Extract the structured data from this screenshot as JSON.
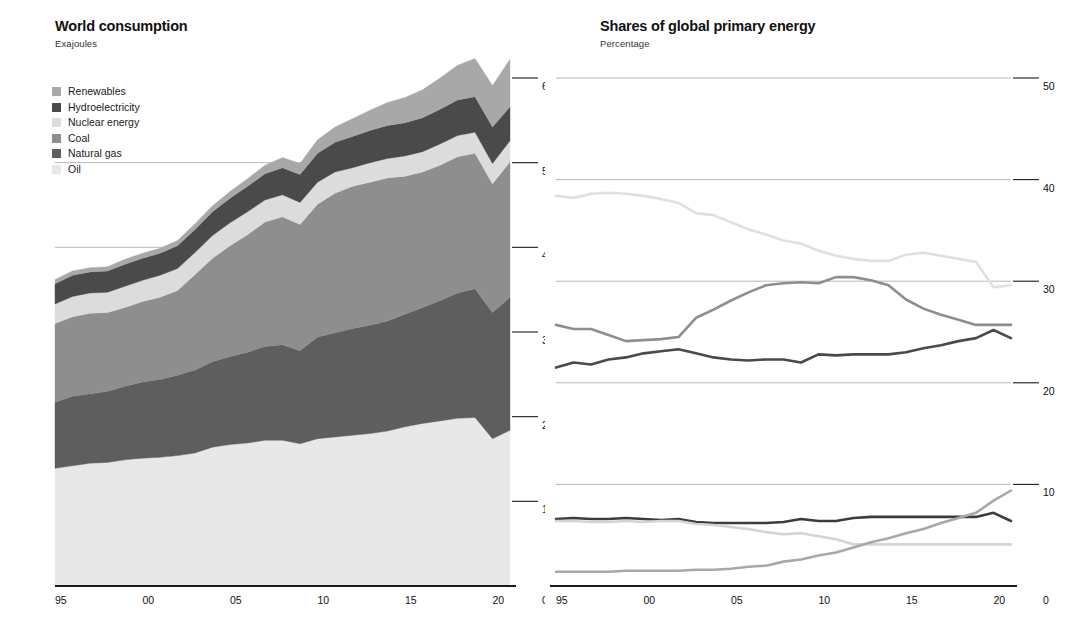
{
  "left": {
    "title": "World consumption",
    "subtitle": "Exajoules",
    "legend": [
      {
        "label": "Renewables",
        "color": "#a8a8a8"
      },
      {
        "label": "Hydroelectricity",
        "color": "#4a4a4a"
      },
      {
        "label": "Nuclear energy",
        "color": "#dcdcdc"
      },
      {
        "label": "Coal",
        "color": "#8e8e8e"
      },
      {
        "label": "Natural gas",
        "color": "#5e5e5e"
      },
      {
        "label": "Oil",
        "color": "#e8e8e8"
      }
    ],
    "y_ticks": [
      "0",
      "100",
      "200",
      "300",
      "400",
      "500",
      "600"
    ],
    "x_ticks": [
      "95",
      "00",
      "05",
      "10",
      "15",
      "20"
    ],
    "axis_zero_right": "0"
  },
  "right": {
    "title": "Shares of global primary energy",
    "subtitle": "Percentage",
    "legend_col1": [
      {
        "label": "Oil",
        "color": "#e0e0e0"
      },
      {
        "label": "Coal",
        "color": "#8e8e8e"
      },
      {
        "label": "Natural gas",
        "color": "#4a4a4a"
      }
    ],
    "legend_col2": [
      {
        "label": "Hydroelectricity",
        "color": "#3c3c3c"
      },
      {
        "label": "Nuclear energy",
        "color": "#d4d4d4"
      },
      {
        "label": "Renewables",
        "color": "#a8a8a8"
      }
    ],
    "y_ticks": [
      "0",
      "10",
      "20",
      "30",
      "40",
      "50"
    ],
    "x_ticks": [
      "95",
      "00",
      "05",
      "10",
      "15",
      "20"
    ],
    "axis_zero_left": "0",
    "axis_zero_right": "0"
  },
  "chart_data": [
    {
      "type": "area",
      "title": "World consumption",
      "subtitle": "Exajoules",
      "xlabel": "",
      "ylabel": "Exajoules",
      "stacked": true,
      "grid": true,
      "legend_position": "inside-top-left",
      "xlim": [
        1995,
        2021
      ],
      "ylim": [
        0,
        600
      ],
      "x": [
        1995,
        1996,
        1997,
        1998,
        1999,
        2000,
        2001,
        2002,
        2003,
        2004,
        2005,
        2006,
        2007,
        2008,
        2009,
        2010,
        2011,
        2012,
        2013,
        2014,
        2015,
        2016,
        2017,
        2018,
        2019,
        2020,
        2021
      ],
      "series": [
        {
          "name": "Oil",
          "color": "#e8e8e8",
          "values": [
            139,
            142,
            145,
            146,
            149,
            151,
            152,
            154,
            157,
            164,
            167,
            169,
            172,
            172,
            168,
            174,
            176,
            178,
            180,
            183,
            188,
            192,
            195,
            198,
            199,
            174,
            184
          ]
        },
        {
          "name": "Natural gas",
          "color": "#5e5e5e",
          "values": [
            78,
            82,
            82,
            84,
            87,
            90,
            92,
            95,
            98,
            101,
            104,
            107,
            111,
            113,
            110,
            120,
            123,
            126,
            128,
            130,
            133,
            137,
            142,
            148,
            152,
            149,
            157
          ]
        },
        {
          "name": "Coal",
          "color": "#8e8e8e",
          "values": [
            93,
            94,
            95,
            93,
            93,
            95,
            97,
            100,
            113,
            122,
            131,
            139,
            147,
            151,
            149,
            157,
            165,
            168,
            169,
            169,
            163,
            160,
            160,
            161,
            160,
            152,
            160
          ]
        },
        {
          "name": "Nuclear energy",
          "color": "#dcdcdc",
          "values": [
            23,
            24,
            24,
            24,
            25,
            25,
            26,
            26,
            26,
            27,
            27,
            27,
            26,
            26,
            26,
            26,
            25,
            22,
            23,
            23,
            24,
            24,
            25,
            25,
            25,
            24,
            25
          ]
        },
        {
          "name": "Hydroelectricity",
          "color": "#4a4a4a",
          "values": [
            24,
            25,
            25,
            25,
            26,
            26,
            26,
            27,
            27,
            28,
            29,
            30,
            31,
            32,
            33,
            34,
            35,
            37,
            38,
            39,
            39,
            40,
            41,
            42,
            42,
            43,
            40
          ]
        },
        {
          "name": "Renewables",
          "color": "#a8a8a8",
          "values": [
            5,
            5,
            5,
            5,
            6,
            6,
            6,
            6,
            7,
            7,
            8,
            9,
            10,
            12,
            13,
            16,
            18,
            21,
            24,
            27,
            30,
            33,
            37,
            41,
            45,
            49,
            56
          ]
        }
      ],
      "totals": [
        362,
        372,
        376,
        377,
        386,
        393,
        399,
        408,
        428,
        449,
        466,
        481,
        497,
        506,
        499,
        527,
        542,
        552,
        562,
        571,
        577,
        586,
        600,
        615,
        623,
        591,
        622
      ]
    },
    {
      "type": "line",
      "title": "Shares of global primary energy",
      "subtitle": "Percentage",
      "xlabel": "",
      "ylabel": "Percentage",
      "grid": true,
      "legend_position": "top-right",
      "xlim": [
        1995,
        2021
      ],
      "ylim": [
        0,
        50
      ],
      "x": [
        1995,
        1996,
        1997,
        1998,
        1999,
        2000,
        2001,
        2002,
        2003,
        2004,
        2005,
        2006,
        2007,
        2008,
        2009,
        2010,
        2011,
        2012,
        2013,
        2014,
        2015,
        2016,
        2017,
        2018,
        2019,
        2020,
        2021
      ],
      "series": [
        {
          "name": "Oil",
          "color": "#e0e0e0",
          "values": [
            38.4,
            38.2,
            38.6,
            38.7,
            38.6,
            38.4,
            38.1,
            37.7,
            36.7,
            36.5,
            35.8,
            35.1,
            34.6,
            34.0,
            33.7,
            33.0,
            32.5,
            32.2,
            32.0,
            32.0,
            32.6,
            32.8,
            32.5,
            32.2,
            31.9,
            29.4,
            29.6
          ]
        },
        {
          "name": "Coal",
          "color": "#8e8e8e",
          "values": [
            25.7,
            25.3,
            25.3,
            24.7,
            24.1,
            24.2,
            24.3,
            24.5,
            26.4,
            27.2,
            28.1,
            28.9,
            29.6,
            29.8,
            29.9,
            29.8,
            30.4,
            30.4,
            30.1,
            29.6,
            28.2,
            27.3,
            26.7,
            26.2,
            25.7,
            25.7,
            25.7
          ]
        },
        {
          "name": "Natural gas",
          "color": "#4a4a4a",
          "values": [
            21.5,
            22.0,
            21.8,
            22.3,
            22.5,
            22.9,
            23.1,
            23.3,
            22.9,
            22.5,
            22.3,
            22.2,
            22.3,
            22.3,
            22.0,
            22.8,
            22.7,
            22.8,
            22.8,
            22.8,
            23.0,
            23.4,
            23.7,
            24.1,
            24.4,
            25.2,
            24.4
          ]
        },
        {
          "name": "Hydroelectricity",
          "color": "#3c3c3c",
          "values": [
            6.6,
            6.7,
            6.6,
            6.6,
            6.7,
            6.6,
            6.5,
            6.6,
            6.3,
            6.2,
            6.2,
            6.2,
            6.2,
            6.3,
            6.6,
            6.4,
            6.4,
            6.7,
            6.8,
            6.8,
            6.8,
            6.8,
            6.8,
            6.8,
            6.8,
            7.2,
            6.4
          ]
        },
        {
          "name": "Nuclear energy",
          "color": "#d4d4d4",
          "values": [
            6.4,
            6.4,
            6.3,
            6.3,
            6.4,
            6.3,
            6.4,
            6.4,
            6.1,
            6.0,
            5.8,
            5.6,
            5.3,
            5.1,
            5.2,
            4.9,
            4.6,
            4.1,
            4.1,
            4.1,
            4.1,
            4.1,
            4.1,
            4.1,
            4.1,
            4.1,
            4.1
          ]
        },
        {
          "name": "Renewables",
          "color": "#a8a8a8",
          "values": [
            1.4,
            1.4,
            1.4,
            1.4,
            1.5,
            1.5,
            1.5,
            1.5,
            1.6,
            1.6,
            1.7,
            1.9,
            2.0,
            2.4,
            2.6,
            3.0,
            3.3,
            3.8,
            4.3,
            4.7,
            5.2,
            5.6,
            6.2,
            6.7,
            7.2,
            8.4,
            9.4
          ]
        }
      ]
    }
  ]
}
